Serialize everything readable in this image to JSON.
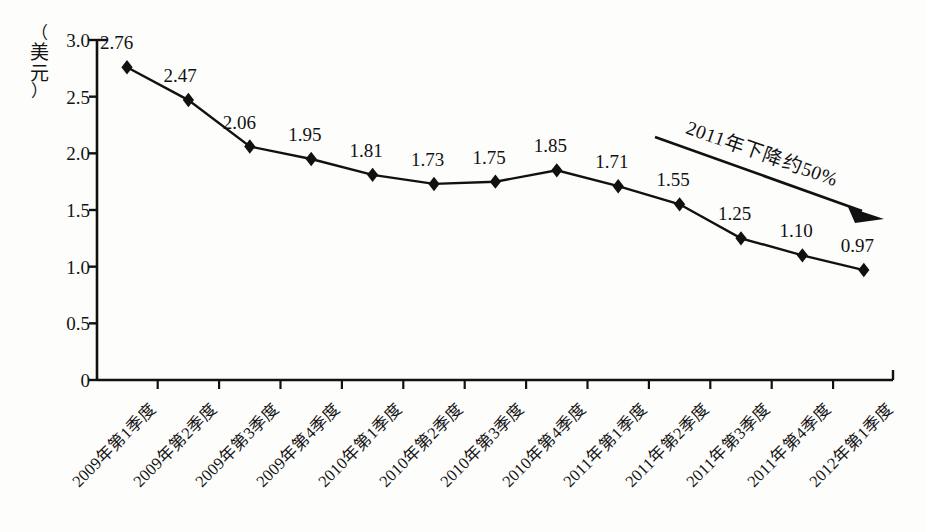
{
  "chart_data": {
    "type": "line",
    "title": "",
    "xlabel": "",
    "ylabel": "（美元）",
    "ylabel_chars": [
      "（",
      "美",
      "元",
      "）"
    ],
    "ylim": [
      0,
      3.0
    ],
    "ytick_values": [
      "0",
      "0.5",
      "1.0",
      "1.5",
      "2.0",
      "2.5",
      "3.0"
    ],
    "grid": false,
    "legend": "none",
    "marker": "diamond",
    "line_color": "#111111",
    "marker_color": "#111111",
    "categories": [
      "2009年第1季度",
      "2009年第2季度",
      "2009年第3季度",
      "2009年第4季度",
      "2010年第1季度",
      "2010年第2季度",
      "2010年第3季度",
      "2010年第4季度",
      "2011年第1季度",
      "2011年第2季度",
      "2011年第3季度",
      "2011年第4季度",
      "2012年第1季度"
    ],
    "values": [
      2.76,
      2.47,
      2.06,
      1.95,
      1.81,
      1.73,
      1.75,
      1.85,
      1.71,
      1.55,
      1.25,
      1.1,
      0.97
    ],
    "value_labels": [
      "2.76",
      "2.47",
      "2.06",
      "1.95",
      "1.81",
      "1.73",
      "1.75",
      "1.85",
      "1.71",
      "1.55",
      "1.25",
      "1.10",
      "0.97"
    ],
    "annotations": [
      {
        "text": "2011年下降约50%",
        "type": "arrow",
        "direction": "down-right"
      }
    ]
  }
}
